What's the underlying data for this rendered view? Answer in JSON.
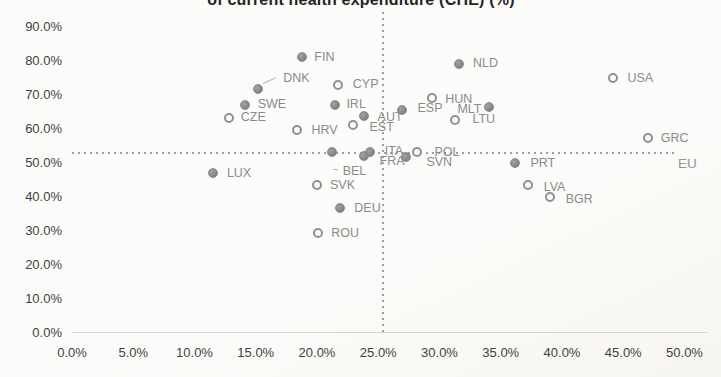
{
  "chart_data": {
    "type": "scatter",
    "title": "of current health expenditure (CHE) (%)",
    "title_cropped_at_top": true,
    "xlabel": "",
    "ylabel": "",
    "grid": false,
    "x_axis": {
      "min": 0,
      "max": 50,
      "tick_step": 5,
      "tick_values": [
        0,
        5,
        10,
        15,
        20,
        25,
        30,
        35,
        40,
        45,
        50
      ],
      "tick_labels": [
        "0.0%",
        "5.0%",
        "10.0%",
        "15.0%",
        "20.0%",
        "25.0%",
        "30.0%",
        "35.0%",
        "40.0%",
        "45.0%",
        "50.0%"
      ]
    },
    "y_axis": {
      "min": 0,
      "max": 90,
      "tick_step": 10,
      "tick_values": [
        0,
        10,
        20,
        30,
        40,
        50,
        60,
        70,
        80,
        90
      ],
      "tick_labels": [
        "0.0%",
        "10.0%",
        "20.0%",
        "30.0%",
        "40.0%",
        "50.0%",
        "60.0%",
        "70.0%",
        "80.0%",
        "90.0%"
      ]
    },
    "reference_lines": {
      "vertical_x": 25.4,
      "horizontal_y": 52.6,
      "label": "EU",
      "style": "dotted"
    },
    "series": [
      {
        "name": "countries",
        "points": [
          {
            "code": "FIN",
            "x": 18.8,
            "y": 81.0,
            "marker": "filled",
            "dx": 12,
            "dy": 0
          },
          {
            "code": "DNK",
            "x": 15.2,
            "y": 71.6,
            "marker": "filled",
            "dx": 25,
            "dy": -11,
            "leader": "diag"
          },
          {
            "code": "CYP",
            "x": 21.7,
            "y": 72.8,
            "marker": "open",
            "dx": 15,
            "dy": -1
          },
          {
            "code": "SWE",
            "x": 14.1,
            "y": 66.9,
            "marker": "filled",
            "dx": 13,
            "dy": -1
          },
          {
            "code": "CZE",
            "x": 12.8,
            "y": 62.8,
            "marker": "open",
            "dx": 12,
            "dy": -1
          },
          {
            "code": "IRL",
            "x": 21.5,
            "y": 66.7,
            "marker": "filled",
            "dx": 11,
            "dy": -1
          },
          {
            "code": "HRV",
            "x": 18.4,
            "y": 59.4,
            "marker": "open",
            "dx": 14,
            "dy": 0
          },
          {
            "code": "EST",
            "x": 22.9,
            "y": 60.8,
            "marker": "open",
            "dx": 17,
            "dy": 2
          },
          {
            "code": "AUT",
            "x": 23.8,
            "y": 63.5,
            "marker": "filled",
            "dx": 14,
            "dy": 1
          },
          {
            "code": "ESP",
            "x": 26.9,
            "y": 65.3,
            "marker": "filled",
            "dx": 16,
            "dy": -2
          },
          {
            "code": "HUN",
            "x": 29.4,
            "y": 68.7,
            "marker": "open",
            "dx": 13,
            "dy": 1
          },
          {
            "code": "MLT",
            "x": 34.0,
            "y": 66.2,
            "marker": "filled",
            "side": "left",
            "dx": -7,
            "dy": 2
          },
          {
            "code": "LTU",
            "x": 31.3,
            "y": 62.3,
            "marker": "open",
            "dx": 17,
            "dy": -1
          },
          {
            "code": "NLD",
            "x": 31.6,
            "y": 78.8,
            "marker": "filled",
            "dx": 14,
            "dy": -1
          },
          {
            "code": "USA",
            "x": 44.2,
            "y": 74.6,
            "marker": "open",
            "dx": 14,
            "dy": 0
          },
          {
            "code": "GRC",
            "x": 47.0,
            "y": 56.9,
            "marker": "open",
            "dx": 13,
            "dy": 0
          },
          {
            "code": "LUX",
            "x": 11.5,
            "y": 46.6,
            "marker": "filled",
            "dx": 14,
            "dy": 0
          },
          {
            "code": "BEL",
            "x": 21.2,
            "y": 53.0,
            "marker": "filled",
            "dx": 11,
            "dy": 19,
            "leader": "dash"
          },
          {
            "code": "SVK",
            "x": 20.0,
            "y": 43.2,
            "marker": "open",
            "dx": 13,
            "dy": 0
          },
          {
            "code": "DEU",
            "x": 21.9,
            "y": 36.3,
            "marker": "filled",
            "dx": 14,
            "dy": 0
          },
          {
            "code": "ROU",
            "x": 20.1,
            "y": 29.0,
            "marker": "open",
            "dx": 13,
            "dy": 0
          },
          {
            "code": "ITA",
            "x": 24.3,
            "y": 53.0,
            "marker": "filled",
            "dx": 15,
            "dy": -1
          },
          {
            "code": "FRA",
            "x": 23.8,
            "y": 51.7,
            "marker": "filled",
            "dx": 16,
            "dy": 5
          },
          {
            "code": "POL",
            "x": 28.2,
            "y": 52.9,
            "marker": "open",
            "dx": 17,
            "dy": 0
          },
          {
            "code": "SVN",
            "x": 27.3,
            "y": 51.4,
            "marker": "filled",
            "dx": 20,
            "dy": 5
          },
          {
            "code": "PRT",
            "x": 36.2,
            "y": 49.7,
            "marker": "filled",
            "dx": 15,
            "dy": 0
          },
          {
            "code": "LVA",
            "x": 37.2,
            "y": 43.2,
            "marker": "open",
            "dx": 16,
            "dy": 2
          },
          {
            "code": "BGR",
            "x": 39.0,
            "y": 39.6,
            "marker": "open",
            "dx": 16,
            "dy": 2
          }
        ]
      }
    ],
    "colors": {
      "filled_marker": "#8c8c8c",
      "open_marker_ring": "#909090",
      "point_label": "#8a8a8a",
      "tick_label": "#3f3f3f",
      "title": "#242424",
      "reference_line": "#9f9f9f",
      "eu_label": "#979593",
      "background": "#fbfaf7"
    }
  }
}
